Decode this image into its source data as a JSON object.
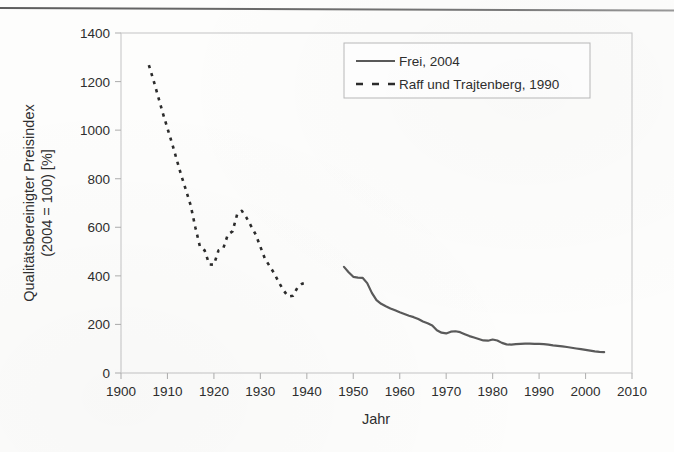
{
  "figure": {
    "background_color": "#fdfdfc",
    "frame_color": "#c9c9c9",
    "tick_color": "#b4b4b4",
    "text_color": "#2e2e2e",
    "scan_line_present": true
  },
  "chart_data": {
    "type": "line",
    "title": "",
    "xlabel": "Jahr",
    "ylabel_line1": "Qualitätsbereinigter Preisindex",
    "ylabel_line2": "(2004 = 100) [%]",
    "xlim": [
      1900,
      2010
    ],
    "ylim": [
      0,
      1400
    ],
    "xticks": [
      1900,
      1910,
      1920,
      1930,
      1940,
      1950,
      1960,
      1970,
      1980,
      1990,
      2000,
      2010
    ],
    "yticks": [
      0,
      200,
      400,
      600,
      800,
      1000,
      1200,
      1400
    ],
    "xtick_labels": [
      "1900",
      "1910",
      "1920",
      "1930",
      "1940",
      "1950",
      "1960",
      "1970",
      "1980",
      "1990",
      "2000",
      "2010"
    ],
    "ytick_labels": [
      "0",
      "200",
      "400",
      "600",
      "800",
      "1000",
      "1200",
      "1400"
    ],
    "grid": false,
    "legend_position": "top-right",
    "series": [
      {
        "name": "Frei, 2004",
        "style": "solid",
        "color": "#5a5a5a",
        "width": 2.2,
        "x": [
          1948,
          1949,
          1950,
          1951,
          1952,
          1953,
          1954,
          1955,
          1956,
          1957,
          1958,
          1959,
          1960,
          1961,
          1962,
          1963,
          1964,
          1965,
          1966,
          1967,
          1968,
          1969,
          1970,
          1971,
          1972,
          1973,
          1974,
          1975,
          1976,
          1977,
          1978,
          1979,
          1980,
          1981,
          1982,
          1983,
          1984,
          1985,
          1986,
          1987,
          1988,
          1989,
          1990,
          1991,
          1992,
          1993,
          1994,
          1995,
          1996,
          1997,
          1998,
          1999,
          2000,
          2001,
          2002,
          2003,
          2004
        ],
        "y": [
          437,
          415,
          396,
          393,
          392,
          370,
          330,
          300,
          285,
          275,
          266,
          258,
          250,
          243,
          236,
          230,
          222,
          212,
          205,
          196,
          176,
          166,
          163,
          170,
          172,
          168,
          160,
          152,
          146,
          140,
          134,
          133,
          138,
          134,
          124,
          118,
          117,
          119,
          120,
          121,
          121,
          120,
          120,
          119,
          117,
          114,
          112,
          110,
          107,
          104,
          101,
          98,
          95,
          92,
          89,
          87,
          86
        ]
      },
      {
        "name": "Raff und Trajtenberg, 1990",
        "style": "dashed",
        "color": "#2b2b2b",
        "width": 2.2,
        "x": [
          1906,
          1907,
          1908,
          1909,
          1910,
          1911,
          1912,
          1913,
          1914,
          1915,
          1916,
          1917,
          1918,
          1919,
          1920,
          1921,
          1922,
          1923,
          1924,
          1925,
          1926,
          1927,
          1928,
          1929,
          1930,
          1931,
          1932,
          1933,
          1934,
          1935,
          1936,
          1937,
          1938,
          1939,
          1940
        ],
        "y": [
          1268,
          1205,
          1138,
          1070,
          1008,
          945,
          878,
          812,
          752,
          690,
          600,
          520,
          505,
          447,
          446,
          505,
          512,
          570,
          583,
          653,
          668,
          640,
          605,
          570,
          520,
          470,
          440,
          410,
          372,
          340,
          315,
          318,
          352,
          368,
          370
        ]
      }
    ]
  },
  "legend": {
    "entries": [
      {
        "label": "Frei, 2004",
        "style": "solid",
        "icon": "solid-line-swatch"
      },
      {
        "label": "Raff und Trajtenberg, 1990",
        "style": "dashed",
        "icon": "dashed-line-swatch"
      }
    ]
  }
}
